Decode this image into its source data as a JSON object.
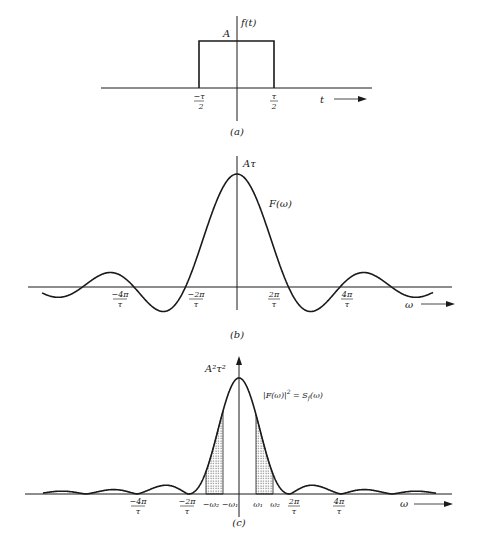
{
  "figure": {
    "panels": [
      {
        "id": "a",
        "caption": "(a)",
        "y_label": "f(t)",
        "amplitude_label": "A",
        "x_label": "t",
        "ticks": [
          {
            "num": "−τ",
            "den": "2"
          },
          {
            "num": "τ",
            "den": "2"
          }
        ]
      },
      {
        "id": "b",
        "caption": "(b)",
        "peak_label": "Aτ",
        "curve_label": "F(ω)",
        "x_label": "ω",
        "ticks": [
          {
            "num": "−4π",
            "den": "τ"
          },
          {
            "num": "−2π",
            "den": "τ"
          },
          {
            "num": "2π",
            "den": "τ"
          },
          {
            "num": "4π",
            "den": "τ"
          }
        ]
      },
      {
        "id": "c",
        "caption": "(c)",
        "peak_label": "A²τ²",
        "curve_label": "|F(ω)|² = Sₙ(ω)",
        "curve_label_main": "|F(ω)|",
        "curve_label_sup": "2",
        "curve_label_rest": " = S",
        "curve_label_sub": "f",
        "curve_label_end": "(ω)",
        "x_label": "ω",
        "ticks": [
          {
            "num": "−4π",
            "den": "τ"
          },
          {
            "num": "−2π",
            "den": "τ"
          },
          {
            "num": "2π",
            "den": "τ"
          },
          {
            "num": "4π",
            "den": "τ"
          }
        ],
        "band_labels": [
          "−ω₂",
          "−ω₁",
          "ω₁",
          "ω₂"
        ]
      }
    ]
  },
  "chart_data": [
    {
      "type": "line",
      "title": "(a) Rectangular pulse f(t)",
      "xlabel": "t",
      "ylabel": "f(t)",
      "description": "f(t) = A for |t| < τ/2, 0 otherwise",
      "x": [
        -1,
        -0.5,
        -0.5,
        0.5,
        0.5,
        1
      ],
      "values": [
        0,
        0,
        1,
        1,
        0,
        0
      ],
      "x_units": "τ",
      "y_units": "A",
      "tick_labels": [
        "−τ/2",
        "τ/2"
      ]
    },
    {
      "type": "line",
      "title": "(b) Fourier transform F(ω)",
      "xlabel": "ω",
      "ylabel": "F(ω)",
      "description": "F(ω) = Aτ sinc(ωτ/2), peak Aτ at ω=0, zeros at multiples of 2π/τ",
      "peak": "Aτ",
      "zero_crossings": [
        "−6π/τ",
        "−4π/τ",
        "−2π/τ",
        "2π/τ",
        "4π/τ",
        "6π/τ"
      ],
      "tick_labels": [
        "−4π/τ",
        "−2π/τ",
        "2π/τ",
        "4π/τ"
      ],
      "xlim_in_2pi_over_tau": [
        -3.8,
        3.8
      ]
    },
    {
      "type": "area",
      "title": "(c) Energy spectral density |F(ω)|² = S_f(ω)",
      "xlabel": "ω",
      "ylabel": "|F(ω)|²",
      "description": "sinc squared with peak A²τ²; shaded bands between ω₁ and ω₂ on both sides",
      "peak": "A²τ²",
      "zeros": [
        "−6π/τ",
        "−4π/τ",
        "−2π/τ",
        "2π/τ",
        "4π/τ",
        "6π/τ"
      ],
      "shaded_bands": [
        [
          "−ω₂",
          "−ω₁"
        ],
        [
          "ω₁",
          "ω₂"
        ]
      ],
      "tick_labels": [
        "−4π/τ",
        "−2π/τ",
        "−ω₂",
        "−ω₁",
        "ω₁",
        "ω₂",
        "2π/τ",
        "4π/τ"
      ]
    }
  ]
}
